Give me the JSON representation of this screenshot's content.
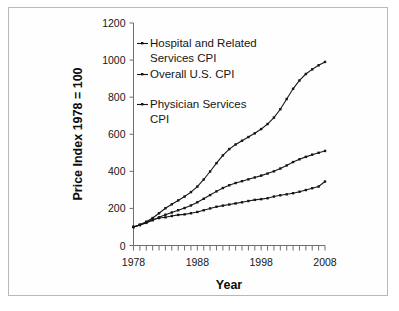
{
  "chart_data": {
    "type": "line",
    "title": "",
    "xlabel": "Year",
    "ylabel": "Price Index 1978 = 100",
    "xlim": [
      1978,
      2008
    ],
    "ylim": [
      0,
      1200
    ],
    "yticks": [
      0,
      200,
      400,
      600,
      800,
      1000,
      1200
    ],
    "ytick_labels": [
      "0",
      "200",
      "400",
      "600",
      "800",
      "1000",
      "1200"
    ],
    "xticks": [
      1978,
      1988,
      1998,
      2008
    ],
    "xtick_labels": [
      "1978",
      "1988",
      "1998",
      "2008"
    ],
    "minor_xticks_every": 1,
    "grid": false,
    "legend_position": "inside-upper-left",
    "x": [
      1978,
      1979,
      1980,
      1981,
      1982,
      1983,
      1984,
      1985,
      1986,
      1987,
      1988,
      1989,
      1990,
      1991,
      1992,
      1993,
      1994,
      1995,
      1996,
      1997,
      1998,
      1999,
      2000,
      2001,
      2002,
      2003,
      2004,
      2005,
      2006,
      2007,
      2008
    ],
    "series": [
      {
        "name": "Hospital and Related Services CPI",
        "marker": "square",
        "color": "#161616",
        "values": [
          100,
          112,
          128,
          148,
          174,
          201,
          222,
          243,
          264,
          288,
          318,
          356,
          399,
          444,
          486,
          520,
          545,
          565,
          585,
          605,
          628,
          655,
          690,
          735,
          790,
          845,
          890,
          925,
          950,
          972,
          990
        ]
      },
      {
        "name": "Overall U.S. CPI",
        "marker": "square",
        "color": "#161616",
        "values": [
          100,
          111,
          126,
          139,
          148,
          152,
          159,
          165,
          168,
          174,
          181,
          190,
          200,
          209,
          215,
          221,
          227,
          233,
          240,
          246,
          250,
          255,
          264,
          271,
          276,
          282,
          290,
          299,
          309,
          318,
          345
        ]
      },
      {
        "name": "Physician Services CPI",
        "marker": "square",
        "color": "#161616",
        "values": [
          100,
          110,
          122,
          136,
          152,
          166,
          178,
          190,
          202,
          216,
          233,
          252,
          272,
          292,
          310,
          325,
          337,
          347,
          357,
          367,
          377,
          388,
          400,
          415,
          432,
          450,
          465,
          478,
          490,
          500,
          510
        ]
      }
    ],
    "legend_entries": [
      {
        "label_line1": "Hospital and Related",
        "label_line2": "Services CPI"
      },
      {
        "label_line1": "Overall U.S. CPI",
        "label_line2": ""
      },
      {
        "label_line1": "Physician Services",
        "label_line2": "CPI"
      }
    ]
  }
}
